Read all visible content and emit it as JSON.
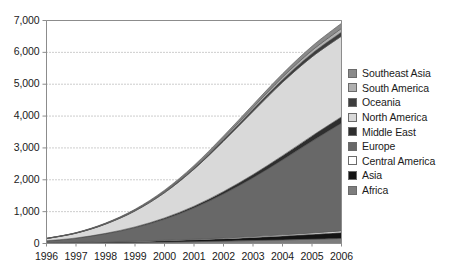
{
  "chart_data": {
    "type": "area",
    "stacked": true,
    "title": "",
    "xlabel": "",
    "ylabel": "",
    "x": [
      1996,
      1997,
      1998,
      1999,
      2000,
      2001,
      2002,
      2003,
      2004,
      2005,
      2006
    ],
    "xtick_labels": [
      "1996",
      "1997",
      "1998",
      "1999",
      "2000",
      "2001",
      "2002",
      "2003",
      "2004",
      "2005",
      "2006"
    ],
    "ytick_labels": [
      "0",
      "1,000",
      "2,000",
      "3,000",
      "4,000",
      "5,000",
      "6,000",
      "7,000"
    ],
    "ytick_values": [
      0,
      1000,
      2000,
      3000,
      4000,
      5000,
      6000,
      7000
    ],
    "ylim": [
      0,
      7000
    ],
    "xlim": [
      1996,
      2006
    ],
    "grid": "horizontal-dotted",
    "legend_position": "right",
    "series": [
      {
        "name": "Africa",
        "color": "#7d7d7d",
        "values": [
          8,
          14,
          22,
          32,
          44,
          58,
          74,
          92,
          112,
          134,
          158
        ]
      },
      {
        "name": "Asia",
        "color": "#141414",
        "values": [
          10,
          16,
          24,
          34,
          46,
          60,
          78,
          100,
          126,
          154,
          186
        ]
      },
      {
        "name": "Central America",
        "color": "#ffffff",
        "values": [
          2,
          4,
          6,
          9,
          12,
          16,
          21,
          27,
          34,
          42,
          52
        ]
      },
      {
        "name": "Europe",
        "color": "#686868",
        "values": [
          60,
          130,
          250,
          420,
          660,
          980,
          1380,
          1840,
          2350,
          2880,
          3380
        ]
      },
      {
        "name": "Middle East",
        "color": "#2e2e2e",
        "values": [
          4,
          9,
          16,
          26,
          40,
          58,
          80,
          106,
          136,
          168,
          202
        ]
      },
      {
        "name": "North America",
        "color": "#d9d9d9",
        "values": [
          70,
          150,
          290,
          500,
          790,
          1160,
          1580,
          1980,
          2300,
          2480,
          2530
        ]
      },
      {
        "name": "Oceania",
        "color": "#3d3d3d",
        "values": [
          3,
          6,
          11,
          18,
          27,
          38,
          52,
          68,
          86,
          106,
          128
        ]
      },
      {
        "name": "South America",
        "color": "#b0b0b0",
        "values": [
          2,
          5,
          9,
          15,
          23,
          33,
          46,
          61,
          78,
          97,
          118
        ]
      },
      {
        "name": "Southeast Asia",
        "color": "#8a8a8a",
        "values": [
          3,
          7,
          13,
          21,
          32,
          46,
          63,
          83,
          106,
          132,
          160
        ]
      }
    ]
  },
  "legend": {
    "items": [
      {
        "label": "Southeast Asia",
        "color": "#8a8a8a"
      },
      {
        "label": "South America",
        "color": "#b0b0b0"
      },
      {
        "label": "Oceania",
        "color": "#3d3d3d"
      },
      {
        "label": "North America",
        "color": "#d9d9d9"
      },
      {
        "label": "Middle East",
        "color": "#2e2e2e"
      },
      {
        "label": "Europe",
        "color": "#686868"
      },
      {
        "label": "Central America",
        "color": "#ffffff"
      },
      {
        "label": "Asia",
        "color": "#141414"
      },
      {
        "label": "Africa",
        "color": "#7d7d7d"
      }
    ]
  },
  "axes": {
    "frame_color": "#8c8c8c",
    "grid_color": "#9a9a9a",
    "text_color": "#1a1a1a"
  }
}
